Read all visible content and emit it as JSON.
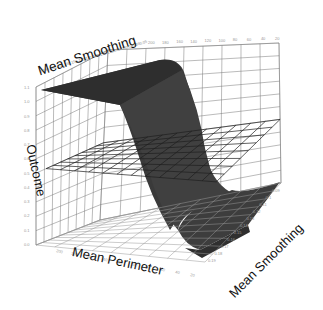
{
  "chart_data": {
    "type": "surface3d",
    "title": "",
    "xlabel": "Mean Perimeter",
    "ylabel": "Mean Smoothing",
    "zlabel": "Outcome",
    "top_axis_label": "Mean Smoothing",
    "x_ticks_top": [
      "200",
      "180",
      "160",
      "140",
      "120",
      "100",
      "80",
      "60",
      "40",
      "20"
    ],
    "x_ticks_bottom": [
      "200",
      "180",
      "160",
      "140",
      "120",
      "100",
      "80",
      "60",
      "40",
      "20"
    ],
    "y_ticks": [
      "0.19",
      "0.18",
      "0.17",
      "0.16",
      "0.15",
      "0.14",
      "0.13",
      "0.12",
      "0.11",
      "0.1",
      "0.09",
      "0.08",
      "0.07",
      "0.06",
      "0.05"
    ],
    "z_ticks": [
      "0.0",
      "0.1",
      "0.2",
      "0.3",
      "0.4",
      "0.5",
      "0.6",
      "0.7",
      "0.8",
      "0.9",
      "1.0",
      "1.1"
    ],
    "zlim": [
      0,
      1.1
    ],
    "xlim": [
      20,
      200
    ],
    "ylim": [
      0.05,
      0.19
    ],
    "decision_plane_z": 0.5,
    "surface": {
      "description": "Logistic (sigmoid) surface: Outcome ≈ 1 for high Mean Perimeter, drops to ≈ 0 for low Mean Perimeter; transition roughly around Mean Perimeter ≈ 100",
      "high_value": 1.0,
      "low_value": 0.0,
      "transition_center_x": 100,
      "color": "#3c3c3c"
    },
    "grid": true,
    "legend": null
  },
  "labels": {
    "top": "Mean Smoothing",
    "z": "Outcome",
    "bottom": "Mean Perimeter",
    "right": "Mean Smoothing"
  },
  "colors": {
    "surface": "#3c3c3c",
    "surface_dark": "#2a2a2a",
    "grid": "#777777",
    "plane": "#222222",
    "tick": "#999999",
    "text": "#111111"
  }
}
